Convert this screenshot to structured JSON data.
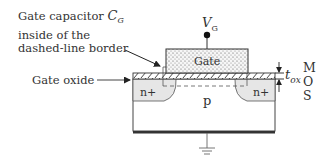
{
  "diagram": {
    "annotations": {
      "gate_capacitor_line1": "Gate capacitor",
      "gate_capacitor_symbol": "C",
      "gate_capacitor_sub": "G",
      "gate_capacitor_line2": "inside of the",
      "gate_capacitor_line3": "dashed-line border",
      "gate_oxide": "Gate oxide"
    },
    "terminal": {
      "symbol": "V",
      "sub": "G"
    },
    "regions": {
      "gate": "Gate",
      "source_drain_left": "n+",
      "source_drain_right": "n+",
      "substrate": "p"
    },
    "thickness": {
      "symbol": "t",
      "sub": "ox"
    },
    "layers": {
      "m": "M",
      "o": "O",
      "s": "S"
    },
    "colors": {
      "line": "#333333",
      "n_plus_fill": "#e8e8e8",
      "gate_fill": "#f4f4f4",
      "background": "#ffffff"
    }
  }
}
